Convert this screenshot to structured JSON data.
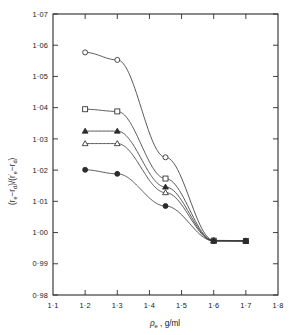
{
  "chart_data": {
    "type": "line",
    "title": "",
    "xlabel": "ρe , g/ml",
    "ylabel": "(re − rd)/(r'e − rd)",
    "xlim": [
      1.1,
      1.8
    ],
    "ylim": [
      0.98,
      1.07
    ],
    "grid": false,
    "legend": "none",
    "xticks": [
      "1·1",
      "1·2",
      "1·3",
      "1·4",
      "1·5",
      "1·6",
      "1·7",
      "1·8"
    ],
    "xtick_values": [
      1.1,
      1.2,
      1.3,
      1.4,
      1.5,
      1.6,
      1.7,
      1.8
    ],
    "yticks": [
      "0·98",
      "0·99",
      "1·00",
      "1·01",
      "1·02",
      "1·03",
      "1·04",
      "1·05",
      "1·06",
      "1·07"
    ],
    "ytick_values": [
      0.98,
      0.99,
      1.0,
      1.01,
      1.02,
      1.03,
      1.04,
      1.05,
      1.06,
      1.07
    ],
    "series": [
      {
        "name": "series-open-circle",
        "marker": "open-circle",
        "x": [
          1.2,
          1.3,
          1.45,
          1.6,
          1.7
        ],
        "values": [
          1.0577,
          1.0553,
          1.0241,
          0.9975,
          0.9974
        ]
      },
      {
        "name": "series-open-square",
        "marker": "open-square",
        "x": [
          1.2,
          1.3,
          1.45,
          1.6,
          1.7
        ],
        "values": [
          1.0395,
          1.0388,
          1.0173,
          0.9974,
          0.9973
        ]
      },
      {
        "name": "series-filled-triangle",
        "marker": "filled-triangle",
        "x": [
          1.2,
          1.3,
          1.45,
          1.6,
          1.7
        ],
        "values": [
          1.0325,
          1.0325,
          1.0146,
          0.9974,
          0.9973
        ]
      },
      {
        "name": "series-open-triangle",
        "marker": "open-triangle",
        "x": [
          1.2,
          1.3,
          1.45,
          1.6,
          1.7
        ],
        "values": [
          1.0285,
          1.0285,
          1.0128,
          0.9973,
          0.9973
        ]
      },
      {
        "name": "series-filled-circle",
        "marker": "filled-circle",
        "x": [
          1.2,
          1.3,
          1.45,
          1.6,
          1.7
        ],
        "values": [
          1.0201,
          1.0188,
          1.0085,
          0.9973,
          0.9973
        ]
      }
    ]
  },
  "axes": {
    "x_title": "ρ",
    "x_title_sub": "e",
    "x_title_rest": ", g/ml",
    "y_title_text": "(r",
    "y_title_full": "(re − rd) / (r'e − rd)"
  }
}
